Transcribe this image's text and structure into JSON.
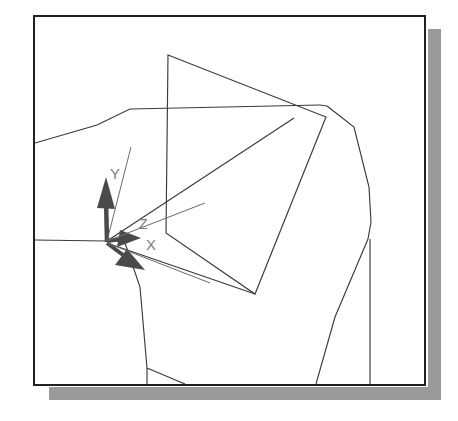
{
  "window": {
    "kind": "cad-3d-viewport",
    "background_color": "#ffffff",
    "border_color": "#202020",
    "shadow_color": "#9a9a9a"
  },
  "axis_triad": {
    "origin_label": "",
    "line_color": "#555555",
    "arrow_color": "#4a4a4a",
    "label_color": "#7d7d7d",
    "axes": [
      {
        "name": "y-axis",
        "label": "Y",
        "direction": "up",
        "label_x": 113,
        "label_y": 172
      },
      {
        "name": "z-axis",
        "label": "Z",
        "direction": "right",
        "label_x": 139,
        "label_y": 222
      },
      {
        "name": "x-axis",
        "label": "X",
        "direction": "down-right",
        "label_x": 147,
        "label_y": 243
      }
    ]
  },
  "geometry": {
    "line_color": "#3a3a3a",
    "description": "wireframe solid model with tilted planar face",
    "edges": [
      "outer-body-upper-left",
      "outer-body-top-ridge",
      "outer-body-right-flank",
      "outer-body-lower-left",
      "outer-body-bottom",
      "tilted-face-quad",
      "interior-diagonal"
    ]
  }
}
